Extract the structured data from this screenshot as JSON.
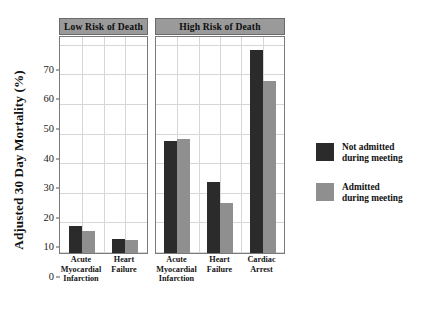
{
  "chart_data": {
    "type": "bar",
    "title": "",
    "xlabel": "",
    "ylabel": "Adjusted 30 Day Mortality (%)",
    "ylim": [
      0,
      73
    ],
    "yticks": [
      0,
      10,
      20,
      30,
      40,
      50,
      60,
      70
    ],
    "ytick_labels": [
      "0",
      "10",
      "20",
      "30",
      "40",
      "50",
      "60",
      "70"
    ],
    "grid": true,
    "legend_position": "right",
    "panels": [
      {
        "label": "Low Risk of Death",
        "categories": [
          "Acute Myocardial Infarction",
          "Heart Failure"
        ],
        "category_lines": [
          [
            "Acute",
            "Myocardial",
            "Infarction"
          ],
          [
            "Heart",
            "Failure"
          ]
        ],
        "series": [
          {
            "name": "Not admitted during meeting",
            "color": "#2b2b2b",
            "values": [
              9.0,
              4.6
            ]
          },
          {
            "name": "Admitted during meeting",
            "color": "#8f8f8f",
            "values": [
              7.6,
              4.5
            ]
          }
        ]
      },
      {
        "label": "High Risk of Death",
        "categories": [
          "Acute Myocardial Infarction",
          "Heart Failure",
          "Cardiac Arrest"
        ],
        "category_lines": [
          [
            "Acute",
            "Myocardial",
            "Infarction"
          ],
          [
            "Heart",
            "Failure"
          ],
          [
            "Cardiac",
            "Arrest"
          ]
        ],
        "series": [
          {
            "name": "Not admitted during meeting",
            "color": "#2b2b2b",
            "values": [
              38.0,
              24.1,
              68.5
            ]
          },
          {
            "name": "Admitted during meeting",
            "color": "#8f8f8f",
            "values": [
              38.7,
              16.8,
              58.0
            ]
          }
        ]
      }
    ],
    "legend": [
      {
        "color": "#2b2b2b",
        "line1": "Not admitted",
        "line2": "during meeting"
      },
      {
        "color": "#8f8f8f",
        "line1": "Admitted",
        "line2": "during meeting"
      }
    ]
  }
}
